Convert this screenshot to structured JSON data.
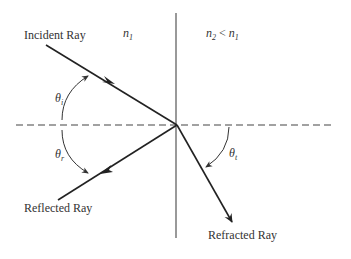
{
  "diagram": {
    "media": {
      "left": {
        "label": "n",
        "subscript": "1"
      },
      "right": {
        "label_a": "n",
        "sub_a": "2",
        "relation": " < ",
        "label_b": "n",
        "sub_b": "1"
      }
    },
    "rays": {
      "incident": "Incident Ray",
      "reflected": "Reflected Ray",
      "refracted": "Refracted Ray"
    },
    "angles": {
      "incident": {
        "symbol": "θ",
        "subscript": "i"
      },
      "reflected": {
        "symbol": "θ",
        "subscript": "r"
      },
      "transmitted": {
        "symbol": "θ",
        "subscript": "t"
      }
    },
    "colors": {
      "line": "#222222",
      "interface": "#555555",
      "dashed": "#444444",
      "text": "#333333"
    }
  }
}
